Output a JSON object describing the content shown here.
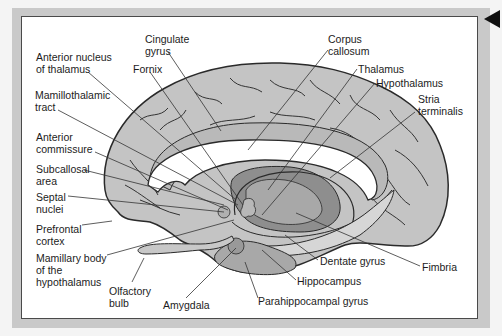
{
  "diagram": {
    "type": "anatomical-brain-sagittal",
    "colors": {
      "page_bg": "#f4f4f4",
      "frame": "#c9c9c9",
      "panel": "#ffffff",
      "cortex": "#c4c4c4",
      "limbic_dark": "#8e8e8e",
      "limbic_mid": "#a8a8a8",
      "corpus_callosum": "#ffffff",
      "outline": "#2a2a2a"
    },
    "labels": [
      {
        "id": "cingulate-gyrus",
        "text": "Cingulate\ngyrus",
        "x": 145,
        "y": 33
      },
      {
        "id": "anterior-nucleus-of-thalamus",
        "text": "Anterior nucleus\nof thalamus",
        "x": 36,
        "y": 51
      },
      {
        "id": "fornix",
        "text": "Fornix",
        "x": 133,
        "y": 63
      },
      {
        "id": "corpus-callosum",
        "text": "Corpus\ncallosum",
        "x": 328,
        "y": 33
      },
      {
        "id": "thalamus",
        "text": "Thalamus",
        "x": 358,
        "y": 63
      },
      {
        "id": "hypothalamus",
        "text": "Hypothalamus",
        "x": 376,
        "y": 77
      },
      {
        "id": "stria-terminalis",
        "text": "Stria\nterminalis",
        "x": 418,
        "y": 93
      },
      {
        "id": "mamillothalamic-tract",
        "text": "Mamillothalamic\ntract",
        "x": 35,
        "y": 89
      },
      {
        "id": "anterior-commissure",
        "text": "Anterior\ncommissure",
        "x": 36,
        "y": 131
      },
      {
        "id": "subcallosal-area",
        "text": "Subcallosal\narea",
        "x": 36,
        "y": 163
      },
      {
        "id": "septal-nuclei",
        "text": "Septal\nnuclei",
        "x": 36,
        "y": 191
      },
      {
        "id": "prefrontal-cortex",
        "text": "Prefrontal\ncortex",
        "x": 36,
        "y": 223
      },
      {
        "id": "mamillary-body",
        "text": "Mamillary body\nof the\nhypothalamus",
        "x": 36,
        "y": 252
      },
      {
        "id": "olfactory-bulb",
        "text": "Olfactory\nbulb",
        "x": 109,
        "y": 285
      },
      {
        "id": "amygdala",
        "text": "Amygdala",
        "x": 163,
        "y": 299
      },
      {
        "id": "dentate-gyrus",
        "text": "Dentate gyrus",
        "x": 320,
        "y": 255
      },
      {
        "id": "fimbria",
        "text": "Fimbria",
        "x": 422,
        "y": 261
      },
      {
        "id": "hippocampus",
        "text": "Hippocampus",
        "x": 297,
        "y": 275
      },
      {
        "id": "parahippocampal-gyrus",
        "text": "Parahippocampal gyrus",
        "x": 258,
        "y": 295
      }
    ],
    "nav": {
      "icon": "back-arrow-icon"
    }
  }
}
